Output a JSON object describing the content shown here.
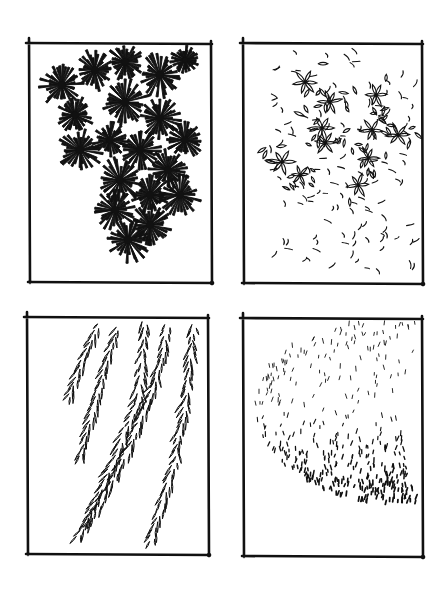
{
  "page": {
    "width": 446,
    "height": 597,
    "background": "#ffffff",
    "ink_color": "#111111"
  },
  "panels": [
    {
      "id": "pine-clusters",
      "description": "Dense radiating needle clusters (pine-like foliage), hanging mass from top",
      "frame": {
        "x1": 29,
        "y1": 43,
        "x2": 211,
        "y2": 282
      },
      "style": "starburst",
      "clusters": [
        [
          62,
          85,
          22
        ],
        [
          95,
          70,
          20
        ],
        [
          125,
          62,
          18
        ],
        [
          160,
          75,
          22
        ],
        [
          185,
          60,
          14
        ],
        [
          75,
          115,
          18
        ],
        [
          125,
          102,
          24
        ],
        [
          160,
          118,
          20
        ],
        [
          185,
          140,
          18
        ],
        [
          80,
          150,
          22
        ],
        [
          110,
          140,
          18
        ],
        [
          140,
          150,
          20
        ],
        [
          168,
          170,
          20
        ],
        [
          120,
          180,
          22
        ],
        [
          150,
          195,
          20
        ],
        [
          180,
          195,
          20
        ],
        [
          115,
          210,
          20
        ],
        [
          150,
          225,
          20
        ],
        [
          128,
          240,
          22
        ]
      ]
    },
    {
      "id": "broadleaf-sparse",
      "description": "Open, loosely outlined leaf clusters with scattered individual leaves",
      "frame": {
        "x1": 243,
        "y1": 43,
        "x2": 422,
        "y2": 283
      },
      "style": "leaf-rosettes",
      "rosettes": [
        [
          305,
          82,
          13
        ],
        [
          330,
          102,
          12
        ],
        [
          376,
          95,
          12
        ],
        [
          372,
          130,
          12
        ],
        [
          322,
          128,
          14
        ],
        [
          282,
          162,
          14
        ],
        [
          325,
          143,
          11
        ],
        [
          398,
          135,
          12
        ],
        [
          368,
          158,
          11
        ],
        [
          358,
          185,
          12
        ],
        [
          300,
          175,
          10
        ]
      ],
      "scatter_region": {
        "x1": 270,
        "y1": 50,
        "x2": 415,
        "y2": 275
      }
    },
    {
      "id": "willow-strands",
      "description": "Drooping willow branches with narrow lanceolate leaves",
      "frame": {
        "x1": 27,
        "y1": 317,
        "x2": 208,
        "y2": 554
      },
      "style": "willow",
      "strands": [
        {
          "points": [
            [
              98,
              325
            ],
            [
              85,
              355
            ],
            [
              68,
              400
            ]
          ],
          "spread": 7
        },
        {
          "points": [
            [
              118,
              328
            ],
            [
              100,
              385
            ],
            [
              80,
              460
            ]
          ],
          "spread": 8
        },
        {
          "points": [
            [
              145,
              322
            ],
            [
              138,
              400
            ],
            [
              110,
              470
            ],
            [
              78,
              540
            ]
          ],
          "spread": 10
        },
        {
          "points": [
            [
              168,
              325
            ],
            [
              155,
              385
            ],
            [
              128,
              450
            ],
            [
              88,
              525
            ]
          ],
          "spread": 9
        },
        {
          "points": [
            [
              193,
              325
            ],
            [
              188,
              390
            ],
            [
              175,
              460
            ],
            [
              150,
              545
            ]
          ],
          "spread": 9
        }
      ]
    },
    {
      "id": "stipple-canopy",
      "description": "Small tick-mark texture forming a rounded canopy, dense at bottom edge and sparse at top",
      "frame": {
        "x1": 243,
        "y1": 318,
        "x2": 422,
        "y2": 556
      },
      "style": "ticks",
      "canopy": {
        "cx": 395,
        "cy": 405,
        "rx": 140,
        "ry": 100
      }
    }
  ]
}
